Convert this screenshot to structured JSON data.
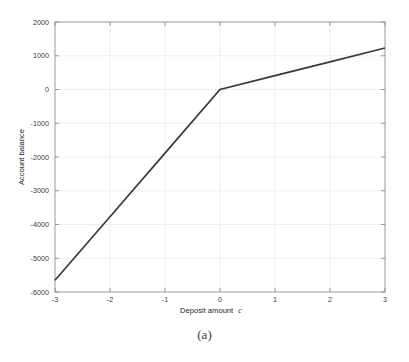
{
  "figure": {
    "caption": "(a)",
    "background_color": "#ffffff"
  },
  "chart_data": {
    "type": "line",
    "title": "",
    "xlabel": "Deposit amount",
    "xlabel_symbol": "c",
    "ylabel": "Account balance",
    "xlim": [
      -3,
      3
    ],
    "ylim": [
      -6000,
      2000
    ],
    "xticks": [
      -3,
      -2,
      -1,
      0,
      1,
      2,
      3
    ],
    "xtick_labels": [
      "-3",
      "-2",
      "-1",
      "0",
      "1",
      "2",
      "3"
    ],
    "yticks": [
      2000,
      1000,
      0,
      -1000,
      -2000,
      -3000,
      -4000,
      -5000,
      -6000
    ],
    "ytick_labels": [
      "2000",
      "1000",
      "0",
      "-1000",
      "-2000",
      "-3000",
      "-4000",
      "-5000",
      "-6000"
    ],
    "grid": true,
    "grid_color": "#ececec",
    "legend": null,
    "line_color": "#3a3a3a",
    "series": [
      {
        "name": "account balance",
        "x": [
          -3,
          -2,
          -1,
          0,
          1,
          2,
          3
        ],
        "values": [
          -5650,
          -3770,
          -1885,
          0,
          410,
          820,
          1230
        ]
      }
    ],
    "breakpoint": {
      "x": 0,
      "y": 0
    },
    "slope_left": 1883,
    "slope_right": 410
  }
}
